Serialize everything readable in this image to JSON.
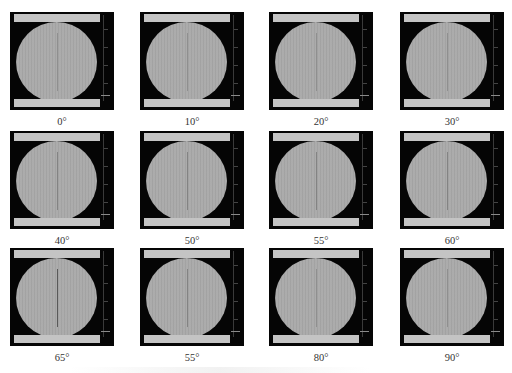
{
  "figure": {
    "panel_colors": {
      "background": "#050505",
      "disc": "#a9a9a9",
      "bars": "#c4c4c4",
      "crack": "#4a4a4a"
    },
    "panels": [
      {
        "label": "0°",
        "crack": "faint"
      },
      {
        "label": "10°",
        "crack": "faint"
      },
      {
        "label": "20°",
        "crack": "faint"
      },
      {
        "label": "30°",
        "crack": "faint"
      },
      {
        "label": "40°",
        "crack": "medium"
      },
      {
        "label": "50°",
        "crack": "medium"
      },
      {
        "label": "55°",
        "crack": "medium"
      },
      {
        "label": "60°",
        "crack": "medium"
      },
      {
        "label": "65°",
        "crack": "strong"
      },
      {
        "label": "55°",
        "crack": "medium"
      },
      {
        "label": "80°",
        "crack": "faint"
      },
      {
        "label": "90°",
        "crack": "faint"
      }
    ],
    "caption": ""
  }
}
